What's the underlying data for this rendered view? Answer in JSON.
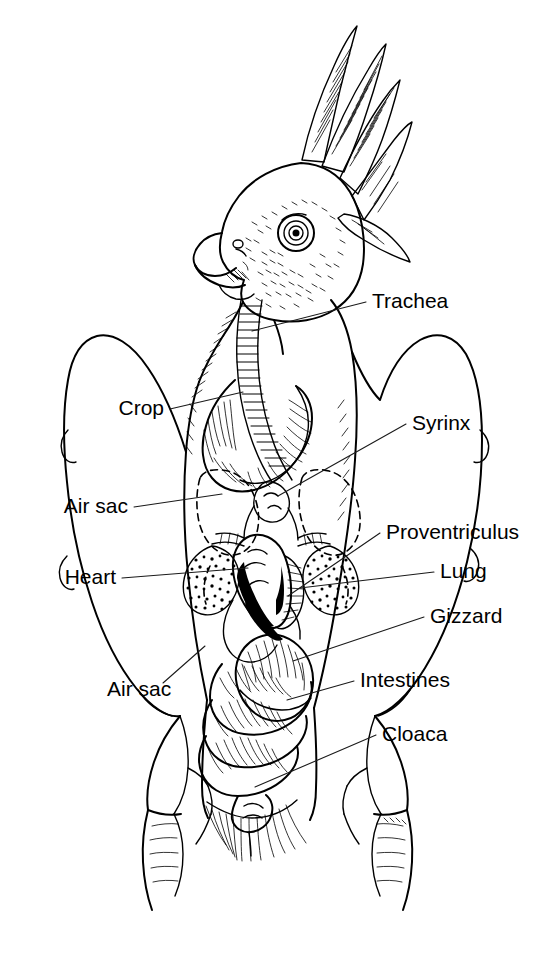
{
  "diagram": {
    "style": "pen-and-ink line drawing",
    "background_color": "#ffffff",
    "ink_color": "#000000",
    "labels": [
      {
        "id": "trachea",
        "text": "Trachea",
        "side": "right",
        "text_x": 372,
        "text_y": 302,
        "leader_from_x": 366,
        "leader_from_y": 302,
        "leader_to_x": 252,
        "leader_to_y": 331
      },
      {
        "id": "crop",
        "text": "Crop",
        "side": "left",
        "text_x": 137,
        "text_y": 409,
        "leader_from_x": 144,
        "leader_from_y": 409,
        "leader_to_x": 243,
        "leader_to_y": 392
      },
      {
        "id": "syrinx",
        "text": "Syrinx",
        "side": "right",
        "text_x": 412,
        "text_y": 424,
        "leader_from_x": 406,
        "leader_from_y": 424,
        "leader_to_x": 278,
        "leader_to_y": 496
      },
      {
        "id": "air-sac-upper",
        "text": "Air sac",
        "side": "left",
        "text_x": 127,
        "text_y": 507,
        "leader_from_x": 134,
        "leader_from_y": 507,
        "leader_to_x": 222,
        "leader_to_y": 494
      },
      {
        "id": "proventriculus",
        "text": "Proventriculus",
        "side": "right",
        "text_x": 386,
        "text_y": 533,
        "leader_from_x": 380,
        "leader_from_y": 533,
        "leader_to_x": 288,
        "leader_to_y": 596
      },
      {
        "id": "heart",
        "text": "Heart",
        "side": "left",
        "text_x": 115,
        "text_y": 578,
        "leader_from_x": 122,
        "leader_from_y": 578,
        "leader_to_x": 248,
        "leader_to_y": 568
      },
      {
        "id": "lung",
        "text": "Lung",
        "side": "right",
        "text_x": 440,
        "text_y": 572,
        "leader_from_x": 434,
        "leader_from_y": 572,
        "leader_to_x": 300,
        "leader_to_y": 588
      },
      {
        "id": "gizzard",
        "text": "Gizzard",
        "side": "right",
        "text_x": 430,
        "text_y": 617,
        "leader_from_x": 424,
        "leader_from_y": 617,
        "leader_to_x": 293,
        "leader_to_y": 661
      },
      {
        "id": "intestines",
        "text": "Intestines",
        "side": "right",
        "text_x": 360,
        "text_y": 681,
        "leader_from_x": 354,
        "leader_from_y": 681,
        "leader_to_x": 287,
        "leader_to_y": 700
      },
      {
        "id": "cloaca",
        "text": "Cloaca",
        "side": "right",
        "text_x": 382,
        "text_y": 735,
        "leader_from_x": 376,
        "leader_from_y": 735,
        "leader_to_x": 255,
        "leader_to_y": 787
      },
      {
        "id": "air-sac-lower",
        "text": "Air sac",
        "side": "left",
        "text_x": 107,
        "text_y": 690,
        "leader_from_x": 163,
        "leader_from_y": 683,
        "leader_to_x": 205,
        "leader_to_y": 646
      }
    ]
  }
}
